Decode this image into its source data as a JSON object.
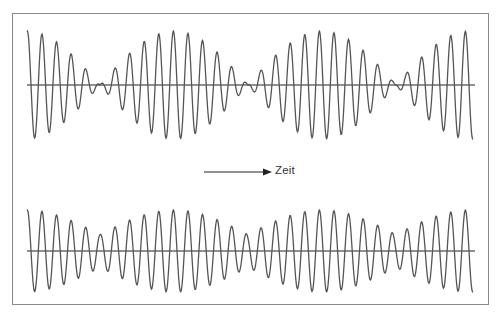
{
  "diagram": {
    "title": "",
    "time_axis_label": "Zeit",
    "colors": {
      "frame": "#8a8a8a",
      "wave": "#555555",
      "axis": "#222222",
      "arrow": "#222222",
      "text": "#333333"
    },
    "waves": [
      {
        "name": "top-beat-wave",
        "description": "Schwebung mit vollständiger Modulation (gleiche Amplituden)",
        "axis_y": 85,
        "x_start": 27,
        "x_end": 473,
        "axis_x_end": 475,
        "carrier_period_px": 14.6,
        "beat_period_px": 148,
        "max_amplitude_px": 54,
        "modulation_depth": 1.0,
        "beat_minima_x": [
          100,
          250,
          397
        ]
      },
      {
        "name": "bottom-beat-wave",
        "description": "Schwebung mit teilweiser Modulation (ungleiche Amplituden)",
        "axis_y": 251,
        "x_start": 27,
        "x_end": 473,
        "axis_x_end": 475,
        "carrier_period_px": 14.6,
        "beat_period_px": 148,
        "max_amplitude_px": 41,
        "modulation_depth": 0.6,
        "beat_minima_x": [
          100,
          250,
          397
        ]
      }
    ],
    "arrow": {
      "x1": 204,
      "x2": 272,
      "y": 172
    }
  }
}
